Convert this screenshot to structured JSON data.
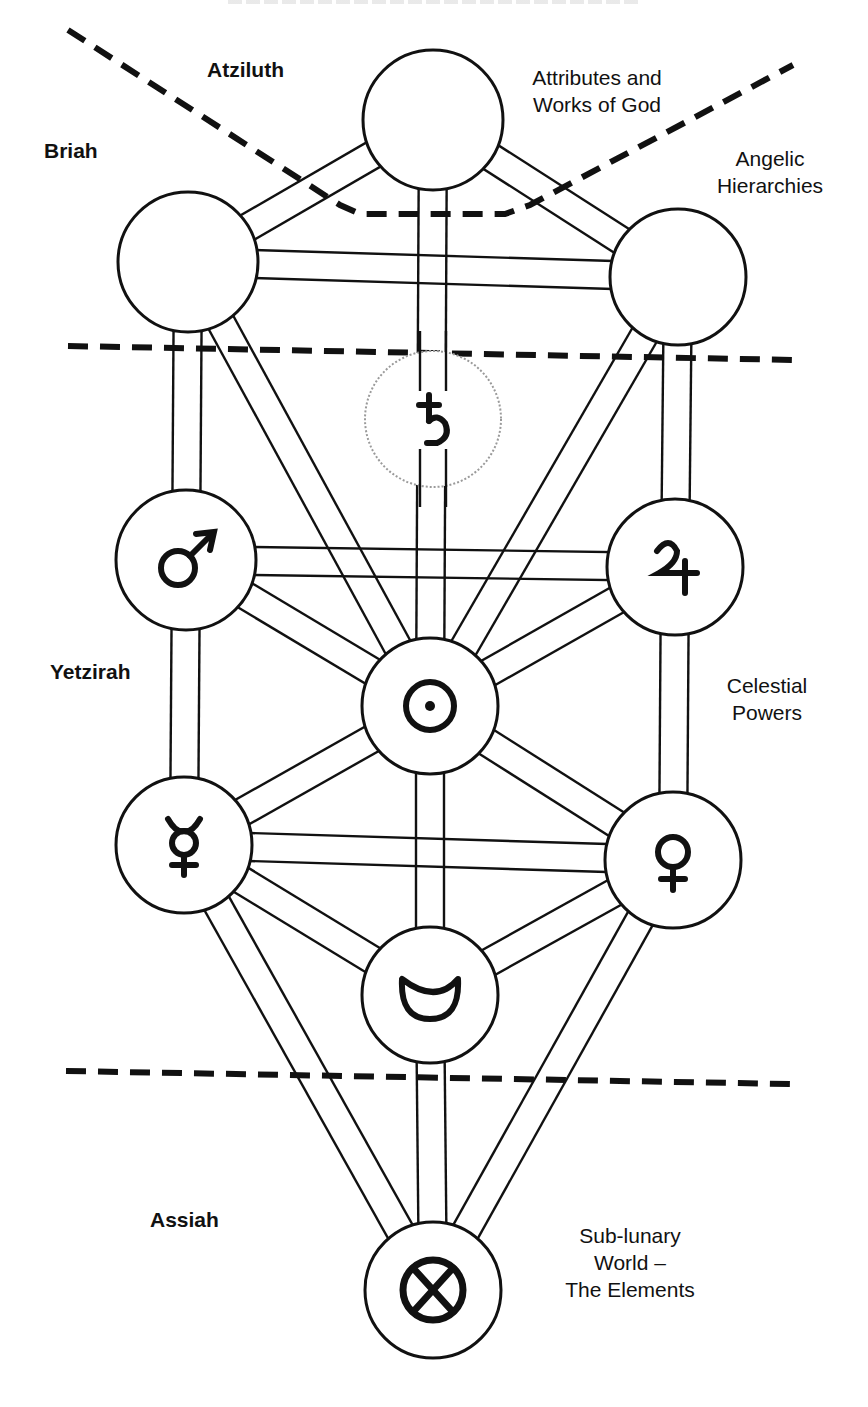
{
  "diagram": {
    "header_clipped": true,
    "colors": {
      "ink": "#111111",
      "daath_ring": "#9a9a9a",
      "background": "#ffffff"
    },
    "worlds": [
      {
        "name": "Atziluth",
        "x": 207,
        "y": 56
      },
      {
        "name": "Briah",
        "x": 44,
        "y": 137
      },
      {
        "name": "Yetzirah",
        "x": 50,
        "y": 658
      },
      {
        "name": "Assiah",
        "x": 150,
        "y": 1206
      }
    ],
    "descriptions": [
      {
        "lines": [
          "Attributes and",
          "Works of God"
        ],
        "x": 512,
        "y": 64,
        "w": 170
      },
      {
        "lines": [
          "Angelic",
          "Hierarchies"
        ],
        "x": 700,
        "y": 145,
        "w": 140
      },
      {
        "lines": [
          "Celestial",
          "Powers"
        ],
        "x": 712,
        "y": 672,
        "w": 110
      },
      {
        "lines": [
          "Sub-lunary",
          "World –",
          "The Elements"
        ],
        "x": 540,
        "y": 1222,
        "w": 180
      }
    ],
    "nodes": [
      {
        "id": "kether",
        "cx": 433,
        "cy": 120,
        "r": 70,
        "symbol": "",
        "symbol_name": "none"
      },
      {
        "id": "binah",
        "cx": 188,
        "cy": 262,
        "r": 70,
        "symbol": "",
        "symbol_name": "none"
      },
      {
        "id": "chokmah",
        "cx": 678,
        "cy": 277,
        "r": 68,
        "symbol": "",
        "symbol_name": "none"
      },
      {
        "id": "daath",
        "cx": 433,
        "cy": 419,
        "r": 68,
        "symbol": "♄",
        "symbol_name": "saturn",
        "dotted": true
      },
      {
        "id": "geburah",
        "cx": 186,
        "cy": 560,
        "r": 70,
        "symbol": "♂",
        "symbol_name": "mars"
      },
      {
        "id": "chesed",
        "cx": 675,
        "cy": 567,
        "r": 68,
        "symbol": "♃",
        "symbol_name": "jupiter"
      },
      {
        "id": "tiphareth",
        "cx": 430,
        "cy": 706,
        "r": 68,
        "symbol": "☉",
        "symbol_name": "sun"
      },
      {
        "id": "hod",
        "cx": 184,
        "cy": 845,
        "r": 68,
        "symbol": "☿",
        "symbol_name": "mercury"
      },
      {
        "id": "netzach",
        "cx": 673,
        "cy": 860,
        "r": 68,
        "symbol": "♀",
        "symbol_name": "venus"
      },
      {
        "id": "yesod",
        "cx": 430,
        "cy": 995,
        "r": 68,
        "symbol": "☽",
        "symbol_name": "moon"
      },
      {
        "id": "malkuth",
        "cx": 433,
        "cy": 1290,
        "r": 68,
        "symbol": "⊗",
        "symbol_name": "elements"
      }
    ],
    "paths": [
      [
        "kether",
        "binah"
      ],
      [
        "kether",
        "chokmah"
      ],
      [
        "kether",
        "tiphareth"
      ],
      [
        "binah",
        "chokmah"
      ],
      [
        "binah",
        "geburah"
      ],
      [
        "binah",
        "tiphareth"
      ],
      [
        "chokmah",
        "chesed"
      ],
      [
        "chokmah",
        "tiphareth"
      ],
      [
        "geburah",
        "chesed"
      ],
      [
        "geburah",
        "tiphareth"
      ],
      [
        "geburah",
        "hod"
      ],
      [
        "chesed",
        "tiphareth"
      ],
      [
        "chesed",
        "netzach"
      ],
      [
        "tiphareth",
        "hod"
      ],
      [
        "tiphareth",
        "netzach"
      ],
      [
        "tiphareth",
        "yesod"
      ],
      [
        "hod",
        "netzach"
      ],
      [
        "hod",
        "yesod"
      ],
      [
        "hod",
        "malkuth"
      ],
      [
        "netzach",
        "yesod"
      ],
      [
        "netzach",
        "malkuth"
      ],
      [
        "yesod",
        "malkuth"
      ]
    ],
    "path_width": 28,
    "dividers": [
      {
        "points": [
          [
            68,
            30
          ],
          [
            340,
            205
          ],
          [
            360,
            214
          ],
          [
            505,
            214
          ],
          [
            530,
            205
          ],
          [
            793,
            65
          ]
        ]
      },
      {
        "points": [
          [
            68,
            346
          ],
          [
            793,
            360
          ]
        ]
      },
      {
        "points": [
          [
            66,
            1071
          ],
          [
            790,
            1084
          ]
        ]
      }
    ]
  }
}
